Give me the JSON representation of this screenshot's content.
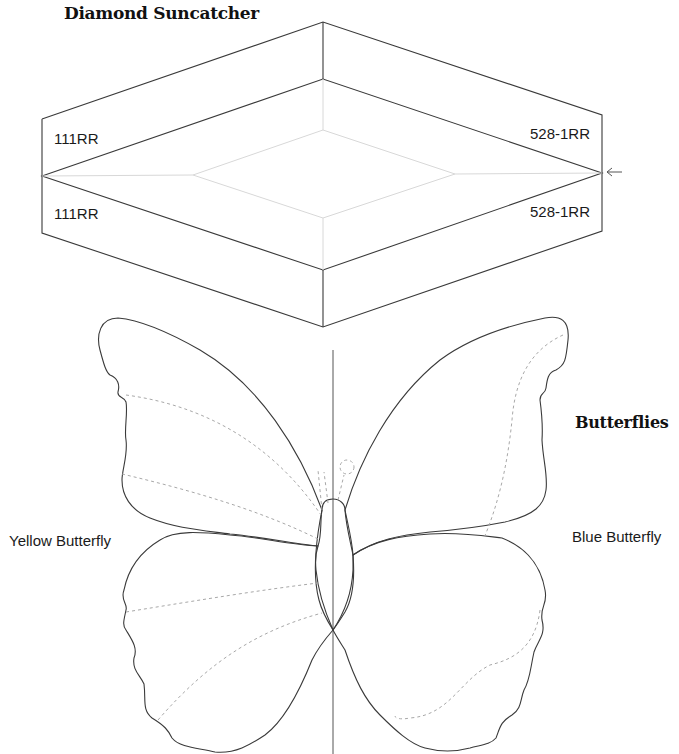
{
  "diamond": {
    "title": "Diamond Suncatcher",
    "labels": {
      "top_left": "111RR",
      "bottom_left": "111RR",
      "top_right": "528-1RR",
      "bottom_right": "528-1RR"
    },
    "arrow_icon": "left-arrow-icon"
  },
  "butterflies": {
    "title": "Butterflies",
    "left_label": "Yellow Butterfly",
    "right_label": "Blue Butterfly"
  },
  "colors": {
    "line": "#3a3a3a",
    "faint_line": "#d8d8d8",
    "dashed_line": "#a8a8a8",
    "text": "#1a1a1a"
  }
}
